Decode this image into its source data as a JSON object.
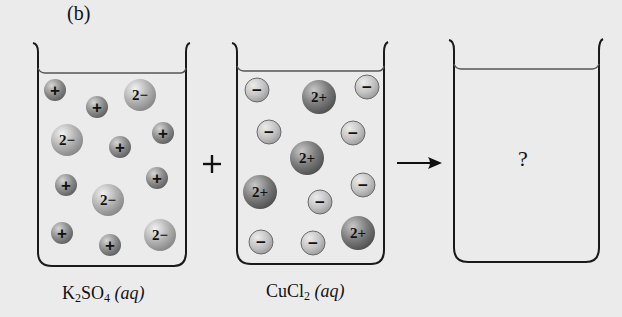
{
  "panel_label": "(b)",
  "operators": {
    "plus": "+",
    "arrow": "→"
  },
  "beakers": [
    {
      "id": "k2so4",
      "label_main": "K",
      "label_sub1": "2",
      "label_mid": "SO",
      "label_sub2": "4",
      "label_state": "(aq)",
      "ions": [
        {
          "charge": "+",
          "type": "cation-small",
          "x": 55,
          "y": 90,
          "r": 11
        },
        {
          "charge": "+",
          "type": "cation-small",
          "x": 97,
          "y": 107,
          "r": 11
        },
        {
          "charge": "2−",
          "type": "anion-large",
          "x": 140,
          "y": 95,
          "r": 16
        },
        {
          "charge": "2−",
          "type": "anion-large",
          "x": 67,
          "y": 140,
          "r": 16
        },
        {
          "charge": "+",
          "type": "cation-small",
          "x": 120,
          "y": 147,
          "r": 11
        },
        {
          "charge": "+",
          "type": "cation-small",
          "x": 163,
          "y": 133,
          "r": 11
        },
        {
          "charge": "+",
          "type": "cation-small",
          "x": 66,
          "y": 185,
          "r": 11
        },
        {
          "charge": "2−",
          "type": "anion-large",
          "x": 108,
          "y": 200,
          "r": 16
        },
        {
          "charge": "+",
          "type": "cation-small",
          "x": 157,
          "y": 178,
          "r": 11
        },
        {
          "charge": "+",
          "type": "cation-small",
          "x": 62,
          "y": 233,
          "r": 11
        },
        {
          "charge": "+",
          "type": "cation-small",
          "x": 110,
          "y": 245,
          "r": 11
        },
        {
          "charge": "2−",
          "type": "anion-large",
          "x": 160,
          "y": 235,
          "r": 16
        }
      ]
    },
    {
      "id": "cucl2",
      "label_main": "CuCl",
      "label_sub1": "2",
      "label_state": "(aq)",
      "ions": [
        {
          "charge": "−",
          "type": "anion-small",
          "x": 257,
          "y": 90,
          "r": 12
        },
        {
          "charge": "2+",
          "type": "cation-large",
          "x": 319,
          "y": 97,
          "r": 17
        },
        {
          "charge": "−",
          "type": "anion-small",
          "x": 367,
          "y": 87,
          "r": 12
        },
        {
          "charge": "−",
          "type": "anion-small",
          "x": 269,
          "y": 132,
          "r": 12
        },
        {
          "charge": "−",
          "type": "anion-small",
          "x": 353,
          "y": 133,
          "r": 12
        },
        {
          "charge": "2+",
          "type": "cation-large",
          "x": 307,
          "y": 158,
          "r": 17
        },
        {
          "charge": "2+",
          "type": "cation-large",
          "x": 260,
          "y": 192,
          "r": 17
        },
        {
          "charge": "−",
          "type": "anion-small",
          "x": 320,
          "y": 202,
          "r": 12
        },
        {
          "charge": "−",
          "type": "anion-small",
          "x": 363,
          "y": 185,
          "r": 12
        },
        {
          "charge": "−",
          "type": "anion-small",
          "x": 261,
          "y": 242,
          "r": 12
        },
        {
          "charge": "−",
          "type": "anion-small",
          "x": 313,
          "y": 243,
          "r": 12
        },
        {
          "charge": "2+",
          "type": "cation-large",
          "x": 358,
          "y": 233,
          "r": 17
        }
      ]
    },
    {
      "id": "product",
      "contents": "?"
    }
  ],
  "colors": {
    "background": "#ebebeb",
    "beaker_outline": "#1a1a1a",
    "k_ion": "#8c8c8c",
    "so4_ion": "#b0b0b0",
    "cu_ion": "#7a7a7a",
    "cl_ion": "#c4c4c4"
  }
}
